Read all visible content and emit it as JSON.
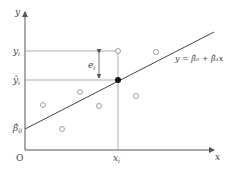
{
  "diagram": {
    "axes": {
      "x_label": "x",
      "y_label": "y",
      "origin_label": "O"
    },
    "labels": {
      "yi": "y",
      "yi_sub": "i",
      "yhat_i": "ŷ",
      "yhat_sub": "i",
      "beta0": "β̂",
      "beta0_sub": "0",
      "xi": "x",
      "xi_sub": "i",
      "residual": "e",
      "residual_sub": "i",
      "equation": "y = β̂₀ + β̂₁x"
    },
    "colors": {
      "axis": "#555555",
      "line": "#444444",
      "guide": "#9a9a9a",
      "point": "#888888",
      "fitted": "#111111"
    },
    "data_points": [
      {
        "x": 43,
        "y": 105
      },
      {
        "x": 62,
        "y": 129
      },
      {
        "x": 80,
        "y": 92
      },
      {
        "x": 99,
        "y": 106
      },
      {
        "x": 118,
        "y": 51
      },
      {
        "x": 136,
        "y": 96
      },
      {
        "x": 156,
        "y": 52
      }
    ],
    "fitted_point": {
      "x": 118,
      "y": 80
    }
  }
}
